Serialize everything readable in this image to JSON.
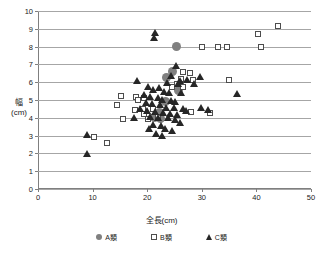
{
  "chart_data": {
    "type": "scatter",
    "title": "",
    "xlabel": "全長(cm)",
    "ylabel_main": "幅",
    "ylabel_unit": "(cm)",
    "xlim": [
      0,
      50
    ],
    "ylim": [
      0,
      10
    ],
    "xticks": [
      0,
      10,
      20,
      30,
      40,
      50
    ],
    "yticks": [
      0,
      1,
      2,
      3,
      4,
      5,
      6,
      7,
      8,
      9,
      10
    ],
    "grid": "horizontal",
    "legend_position": "bottom",
    "series": [
      {
        "name": "A類",
        "marker": "circle",
        "color": "#808080",
        "points": [
          [
            25.4,
            8.0
          ],
          [
            24.6,
            6.6
          ],
          [
            23.5,
            6.25
          ],
          [
            25.8,
            5.55
          ],
          [
            23.3,
            4.9
          ],
          [
            22.3,
            4.3
          ],
          [
            21.3,
            4.0
          ],
          [
            22.5,
            3.95
          ]
        ]
      },
      {
        "name": "B類",
        "marker": "square",
        "color": "#4d4d4d",
        "points": [
          [
            44.0,
            9.15
          ],
          [
            40.3,
            8.7
          ],
          [
            30.0,
            8.0
          ],
          [
            33.0,
            8.0
          ],
          [
            34.6,
            8.0
          ],
          [
            40.8,
            8.0
          ],
          [
            26.5,
            6.55
          ],
          [
            27.9,
            6.5
          ],
          [
            26.1,
            6.2
          ],
          [
            28.3,
            6.1
          ],
          [
            35.0,
            6.1
          ],
          [
            25.5,
            5.9
          ],
          [
            26.6,
            5.75
          ],
          [
            24.5,
            5.75
          ],
          [
            15.2,
            5.25
          ],
          [
            18.0,
            5.15
          ],
          [
            19.5,
            5.1
          ],
          [
            14.4,
            4.7
          ],
          [
            19.2,
            4.5
          ],
          [
            21.0,
            4.5
          ],
          [
            15.6,
            3.95
          ],
          [
            20.2,
            3.95
          ],
          [
            17.8,
            4.45
          ],
          [
            18.3,
            5.0
          ],
          [
            28.0,
            4.3
          ],
          [
            31.5,
            4.25
          ],
          [
            19.4,
            4.2
          ],
          [
            22.0,
            4.05
          ],
          [
            10.2,
            2.9
          ],
          [
            12.6,
            2.6
          ]
        ]
      },
      {
        "name": "C類",
        "marker": "triangle",
        "color": "#262626",
        "points": [
          [
            21.5,
            8.8
          ],
          [
            21.2,
            8.5
          ],
          [
            25.2,
            6.95
          ],
          [
            29.6,
            6.3
          ],
          [
            27.3,
            6.15
          ],
          [
            26.0,
            6.1
          ],
          [
            25.6,
            5.95
          ],
          [
            24.3,
            6.35
          ],
          [
            23.6,
            6.0
          ],
          [
            28.6,
            5.9
          ],
          [
            18.2,
            6.1
          ],
          [
            20.2,
            5.75
          ],
          [
            21.0,
            5.6
          ],
          [
            22.2,
            5.7
          ],
          [
            23.0,
            5.45
          ],
          [
            24.0,
            5.4
          ],
          [
            26.2,
            5.4
          ],
          [
            36.5,
            5.35
          ],
          [
            19.5,
            5.3
          ],
          [
            20.6,
            5.2
          ],
          [
            21.9,
            5.15
          ],
          [
            22.8,
            5.05
          ],
          [
            24.4,
            5.0
          ],
          [
            25.0,
            4.9
          ],
          [
            19.8,
            4.85
          ],
          [
            20.9,
            4.8
          ],
          [
            22.4,
            4.75
          ],
          [
            23.4,
            4.6
          ],
          [
            24.9,
            4.6
          ],
          [
            26.6,
            4.55
          ],
          [
            29.8,
            4.6
          ],
          [
            20.0,
            4.4
          ],
          [
            21.4,
            4.35
          ],
          [
            22.9,
            4.3
          ],
          [
            24.2,
            4.25
          ],
          [
            25.4,
            4.2
          ],
          [
            27.1,
            4.4
          ],
          [
            20.5,
            4.05
          ],
          [
            22.0,
            4.0
          ],
          [
            23.8,
            4.0
          ],
          [
            25.1,
            3.9
          ],
          [
            26.0,
            3.75
          ],
          [
            31.2,
            4.45
          ],
          [
            21.0,
            3.6
          ],
          [
            22.6,
            3.55
          ],
          [
            23.2,
            3.4
          ],
          [
            21.6,
            3.1
          ],
          [
            22.8,
            3.0
          ],
          [
            9.0,
            3.05
          ],
          [
            9.0,
            2.0
          ],
          [
            24.6,
            3.3
          ],
          [
            20.4,
            3.4
          ],
          [
            18.6,
            4.5
          ],
          [
            17.5,
            4.0
          ]
        ]
      }
    ]
  },
  "legend": {
    "items": [
      {
        "label": "A類",
        "marker": "circle"
      },
      {
        "label": "B類",
        "marker": "square"
      },
      {
        "label": "C類",
        "marker": "triangle"
      }
    ]
  }
}
